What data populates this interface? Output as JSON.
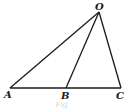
{
  "diagram": {
    "type": "geometry-triangle",
    "stroke_color": "#1a1a1a",
    "points": {
      "O": {
        "label": "O",
        "x": 99,
        "y": 12
      },
      "A": {
        "label": "A",
        "x": 10,
        "y": 88
      },
      "B": {
        "label": "B",
        "x": 66,
        "y": 88
      },
      "C": {
        "label": "C",
        "x": 121,
        "y": 88
      }
    },
    "segments": [
      "OA",
      "OB",
      "OC",
      "AC"
    ],
    "caption": "Fig."
  }
}
